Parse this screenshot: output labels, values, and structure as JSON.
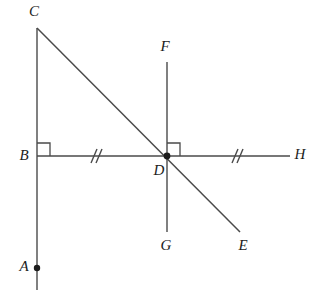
{
  "figure": {
    "type": "geometry-diagram",
    "background_color": "#ffffff",
    "line_color": "#4a4a4a",
    "label_color": "#1c1c1c"
  },
  "labels": {
    "A": "A",
    "B": "B",
    "C": "C",
    "D": "D",
    "E": "E",
    "F": "F",
    "G": "G",
    "H": "H"
  },
  "points": {
    "A": {
      "x": 37,
      "y": 268,
      "label_x": 24,
      "label_y": 268,
      "dot": true
    },
    "B": {
      "x": 37,
      "y": 156,
      "label_x": 24,
      "label_y": 157,
      "dot": false
    },
    "C": {
      "x": 37,
      "y": 28,
      "label_x": 34,
      "label_y": 13,
      "dot": false
    },
    "D": {
      "x": 167,
      "y": 156,
      "label_x": 159,
      "label_y": 172,
      "dot": true
    },
    "E": {
      "x": 240,
      "y": 232,
      "label_x": 243,
      "label_y": 247,
      "dot": false
    },
    "F": {
      "x": 167,
      "y": 62,
      "label_x": 165,
      "label_y": 48,
      "dot": false
    },
    "G": {
      "x": 167,
      "y": 232,
      "label_x": 166,
      "label_y": 247,
      "dot": false
    },
    "H": {
      "x": 290,
      "y": 156,
      "label_x": 300,
      "label_y": 156,
      "dot": false
    }
  },
  "segments": [
    {
      "name": "vertical-line-CA",
      "x1": 37,
      "y1": 28,
      "x2": 37,
      "y2": 290
    },
    {
      "name": "horizontal-line-BH",
      "x1": 37,
      "y1": 156,
      "x2": 290,
      "y2": 156
    },
    {
      "name": "vertical-line-FG",
      "x1": 167,
      "y1": 62,
      "x2": 167,
      "y2": 232
    },
    {
      "name": "diagonal-line-CE",
      "x1": 37,
      "y1": 28,
      "x2": 240,
      "y2": 232
    }
  ],
  "right_angles": [
    {
      "name": "right-angle-at-B",
      "vertex_x": 37,
      "vertex_y": 156,
      "size": 13,
      "dir_x": 1,
      "dir_y": -1
    },
    {
      "name": "right-angle-at-D",
      "vertex_x": 167,
      "vertex_y": 156,
      "size": 13,
      "dir_x": 1,
      "dir_y": -1
    }
  ],
  "tick_marks": [
    {
      "name": "double-tick-BD",
      "cx": 95,
      "cy": 156,
      "count": 2
    },
    {
      "name": "double-tick-DH",
      "cx": 236,
      "cy": 156,
      "count": 2
    }
  ],
  "annotations": {
    "congruent_segments": "BD and DH marked congruent with double tick marks",
    "perpendicular_at_B": "CA is perpendicular to BH at B",
    "perpendicular_at_D": "FG is perpendicular to BH at D"
  }
}
